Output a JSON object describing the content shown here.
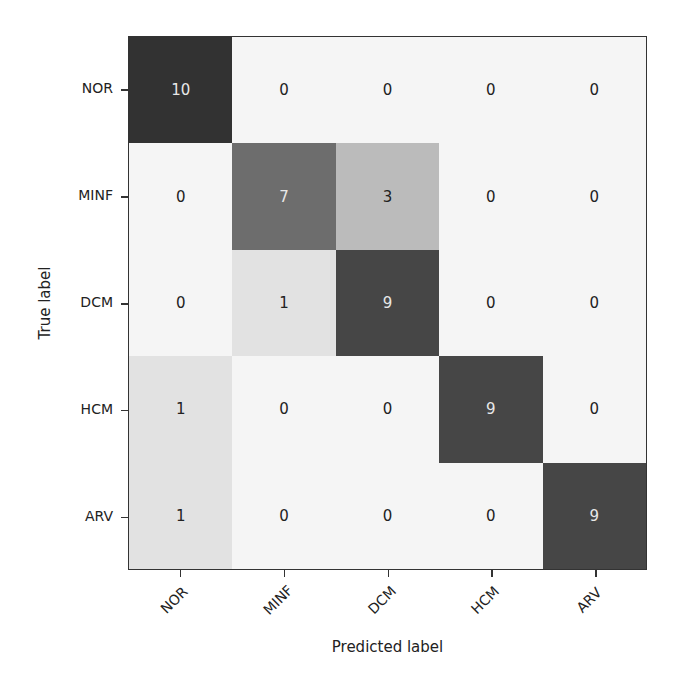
{
  "chart_data": {
    "type": "heatmap",
    "title": "",
    "xlabel": "Predicted label",
    "ylabel": "True label",
    "x_categories": [
      "NOR",
      "MINF",
      "DCM",
      "HCM",
      "ARV"
    ],
    "y_categories": [
      "NOR",
      "MINF",
      "DCM",
      "HCM",
      "ARV"
    ],
    "matrix": [
      [
        10,
        0,
        0,
        0,
        0
      ],
      [
        0,
        7,
        3,
        0,
        0
      ],
      [
        0,
        1,
        9,
        0,
        0
      ],
      [
        1,
        0,
        0,
        9,
        0
      ],
      [
        1,
        0,
        0,
        0,
        9
      ]
    ],
    "colormap": "greys",
    "vmin": 0,
    "vmax": 10,
    "grid": false,
    "legend": "none"
  },
  "axes": {
    "xlabel": "Predicted label",
    "ylabel": "True label",
    "xticks": [
      "NOR",
      "MINF",
      "DCM",
      "HCM",
      "ARV"
    ],
    "yticks": [
      "NOR",
      "MINF",
      "DCM",
      "HCM",
      "ARV"
    ]
  }
}
